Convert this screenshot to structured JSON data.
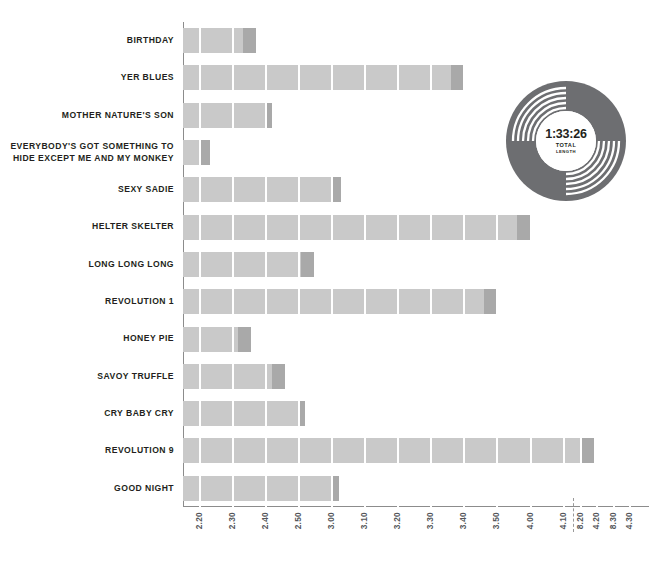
{
  "chart_data": {
    "type": "bar",
    "orientation": "horizontal",
    "title": "",
    "xlabel": "",
    "ylabel": "",
    "grid": true,
    "legend_position": "none",
    "axis_unit": "minutes:seconds",
    "axis_break": {
      "after": "4.40",
      "before": "8.20",
      "style": "dashed"
    },
    "xticks": [
      "2.20",
      "2.30",
      "2.40",
      "2.50",
      "3.00",
      "3.10",
      "3.20",
      "3.30",
      "3.40",
      "3.50",
      "4.00",
      "4.10",
      "4.20",
      "4.30",
      "4.40",
      "8.20",
      "8.30"
    ],
    "xlim": [
      "2.13",
      "8.35"
    ],
    "categories": [
      "BIRTHDAY",
      "YER BLUES",
      "MOTHER NATURE'S SON",
      "EVERYBODY'S GOT SOMETHING TO\nHIDE EXCEPT ME AND MY MONKEY",
      "SEXY SADIE",
      "HELTER SKELTER",
      "LONG LONG LONG",
      "REVOLUTION 1",
      "HONEY PIE",
      "SAVOY TRUFFLE",
      "CRY BABY CRY",
      "REVOLUTION 9",
      "GOOD NIGHT"
    ],
    "values": [
      2.42,
      4.01,
      2.48,
      2.24,
      3.15,
      4.29,
      3.04,
      4.16,
      2.41,
      2.54,
      3.01,
      8.22,
      3.14
    ],
    "value_labels": [
      "2:42",
      "4:01",
      "2:48",
      "2:24",
      "3:15",
      "4:29",
      "3:04",
      "4:16",
      "2:41",
      "2:54",
      "3:01",
      "8:22",
      "3:14"
    ],
    "bar_px_end": [
      256,
      464,
      272,
      210,
      341,
      530,
      314,
      497,
      251,
      285,
      305,
      594,
      339
    ],
    "colors": {
      "bar": "#c9c9c9",
      "bar_tip": "#a9a9a9",
      "axis": "#8c8c8c",
      "label": "#231f20",
      "tick_label": "#54565a",
      "record": "#6d6e71"
    }
  },
  "record_badge": {
    "name": "vinyl-record-total-length",
    "total_length": "1:33:26",
    "caption_line1": "TOTAL",
    "caption_line2": "LENGTH"
  }
}
